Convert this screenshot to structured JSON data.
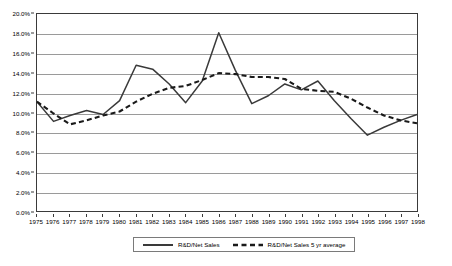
{
  "chart_data": {
    "type": "line",
    "title": "",
    "xlabel": "",
    "ylabel": "",
    "grid": true,
    "legend_position": "bottom",
    "ylim": [
      0,
      20
    ],
    "y_ticks": [
      "0.0%",
      "2.0%",
      "4.0%",
      "6.0%",
      "8.0%",
      "10.0%",
      "12.0%",
      "14.0%",
      "16.0%",
      "18.0%",
      "20.0%"
    ],
    "y_tick_values": [
      0,
      2,
      4,
      6,
      8,
      10,
      12,
      14,
      16,
      18,
      20
    ],
    "categories": [
      "1975",
      "1976",
      "1977",
      "1978",
      "1979",
      "1980",
      "1981",
      "1982",
      "1983",
      "1984",
      "1985",
      "1986",
      "1987",
      "1988",
      "1989",
      "1990",
      "1991",
      "1992",
      "1993",
      "1994",
      "1995",
      "1996",
      "1997",
      "1998"
    ],
    "series": [
      {
        "name": "R&D/Net Sales",
        "style": "solid",
        "color": "#3a3a3a",
        "values": [
          11.1,
          9.1,
          9.7,
          10.2,
          9.8,
          11.2,
          14.8,
          14.4,
          12.9,
          11.0,
          13.2,
          18.1,
          14.3,
          10.9,
          11.7,
          12.9,
          12.3,
          13.2,
          11.2,
          9.4,
          7.7,
          8.5,
          9.2,
          9.8
        ]
      },
      {
        "name": "R&D/Net Sales 5 yr average",
        "style": "dashed",
        "color": "#1a1a1a",
        "values": [
          11.1,
          9.9,
          8.8,
          9.2,
          9.7,
          10.1,
          11.1,
          11.9,
          12.5,
          12.7,
          13.3,
          14.0,
          13.9,
          13.6,
          13.6,
          13.4,
          12.4,
          12.2,
          12.1,
          11.4,
          10.5,
          9.7,
          9.2,
          8.9
        ]
      }
    ]
  },
  "legend": {
    "items": [
      {
        "label": "R&D/Net Sales",
        "style": "solid"
      },
      {
        "label": "R&D/Net Sales 5 yr average",
        "style": "dashed"
      }
    ]
  }
}
